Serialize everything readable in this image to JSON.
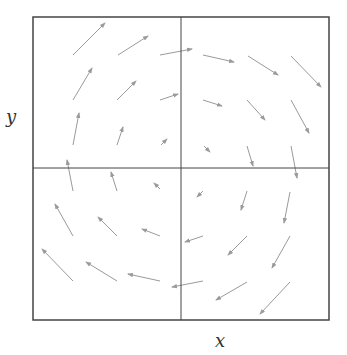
{
  "diagram": {
    "type": "vector-field",
    "xlabel": "x",
    "ylabel": "y",
    "colors": {
      "frame": "#444444",
      "arrow": "#9a9a9a",
      "background": "#ffffff"
    },
    "frame": {
      "x0": 33,
      "y0": 17,
      "x1": 329,
      "y1": 320
    },
    "midlines": {
      "x": 181,
      "y": 168
    },
    "arrows": [
      {
        "x1": 73,
        "y1": 55,
        "x2": 105,
        "y2": 23
      },
      {
        "x1": 118,
        "y1": 55,
        "x2": 148,
        "y2": 36
      },
      {
        "x1": 160,
        "y1": 55,
        "x2": 192,
        "y2": 49
      },
      {
        "x1": 73,
        "y1": 100,
        "x2": 92,
        "y2": 68
      },
      {
        "x1": 117,
        "y1": 100,
        "x2": 136,
        "y2": 81
      },
      {
        "x1": 160,
        "y1": 100,
        "x2": 178,
        "y2": 94
      },
      {
        "x1": 73,
        "y1": 145,
        "x2": 79,
        "y2": 113
      },
      {
        "x1": 117,
        "y1": 145,
        "x2": 123,
        "y2": 127
      },
      {
        "x1": 161,
        "y1": 145,
        "x2": 167,
        "y2": 139
      },
      {
        "x1": 203,
        "y1": 55,
        "x2": 234,
        "y2": 62
      },
      {
        "x1": 248,
        "y1": 56,
        "x2": 278,
        "y2": 75
      },
      {
        "x1": 291,
        "y1": 56,
        "x2": 321,
        "y2": 87
      },
      {
        "x1": 203,
        "y1": 100,
        "x2": 222,
        "y2": 106
      },
      {
        "x1": 247,
        "y1": 100,
        "x2": 265,
        "y2": 120
      },
      {
        "x1": 291,
        "y1": 100,
        "x2": 309,
        "y2": 133
      },
      {
        "x1": 204,
        "y1": 146,
        "x2": 210,
        "y2": 152
      },
      {
        "x1": 247,
        "y1": 146,
        "x2": 253,
        "y2": 166
      },
      {
        "x1": 291,
        "y1": 146,
        "x2": 297,
        "y2": 178
      },
      {
        "x1": 73,
        "y1": 191,
        "x2": 67,
        "y2": 160
      },
      {
        "x1": 117,
        "y1": 191,
        "x2": 111,
        "y2": 172
      },
      {
        "x1": 160,
        "y1": 189,
        "x2": 154,
        "y2": 183
      },
      {
        "x1": 73,
        "y1": 236,
        "x2": 55,
        "y2": 204
      },
      {
        "x1": 117,
        "y1": 236,
        "x2": 98,
        "y2": 217
      },
      {
        "x1": 160,
        "y1": 236,
        "x2": 142,
        "y2": 229
      },
      {
        "x1": 73,
        "y1": 281,
        "x2": 42,
        "y2": 249
      },
      {
        "x1": 117,
        "y1": 281,
        "x2": 86,
        "y2": 262
      },
      {
        "x1": 160,
        "y1": 281,
        "x2": 128,
        "y2": 274
      },
      {
        "x1": 203,
        "y1": 191,
        "x2": 197,
        "y2": 197
      },
      {
        "x1": 247,
        "y1": 191,
        "x2": 241,
        "y2": 210
      },
      {
        "x1": 290,
        "y1": 192,
        "x2": 284,
        "y2": 223
      },
      {
        "x1": 203,
        "y1": 236,
        "x2": 185,
        "y2": 242
      },
      {
        "x1": 247,
        "y1": 236,
        "x2": 228,
        "y2": 255
      },
      {
        "x1": 290,
        "y1": 236,
        "x2": 272,
        "y2": 268
      },
      {
        "x1": 203,
        "y1": 281,
        "x2": 172,
        "y2": 287
      },
      {
        "x1": 247,
        "y1": 282,
        "x2": 216,
        "y2": 300
      },
      {
        "x1": 290,
        "y1": 282,
        "x2": 260,
        "y2": 314
      }
    ]
  }
}
